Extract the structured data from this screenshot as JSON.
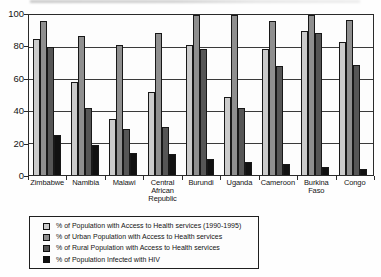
{
  "chart_data": {
    "type": "bar",
    "title": "",
    "xlabel": "",
    "ylabel": "",
    "categories": [
      "Zimbabwe",
      "Namibia",
      "Malawi",
      "Central African Republic",
      "Burundi",
      "Uganda",
      "Cameroon",
      "Burkina Faso",
      "Congo"
    ],
    "series": [
      {
        "name": "% of Population with Access to Health services (1990-1995)",
        "color": "#cbcbcb",
        "values": [
          85,
          58,
          35,
          52,
          81,
          49,
          79,
          90,
          83
        ]
      },
      {
        "name": "% of Urban Population with Access to Health services",
        "color": "#8f8f8f",
        "values": [
          96,
          87,
          81,
          89,
          100,
          100,
          96,
          100,
          97
        ]
      },
      {
        "name": "% of Rural Population with Access to Health services",
        "color": "#565656",
        "values": [
          80,
          42,
          29,
          30,
          79,
          42,
          68,
          89,
          69
        ]
      },
      {
        "name": "% of Population Infected with HIV",
        "color": "#111111",
        "values": [
          25,
          19,
          14,
          13,
          10,
          8,
          7,
          5,
          4
        ]
      }
    ],
    "ylim": [
      0,
      100
    ],
    "yticks": [
      0,
      20,
      40,
      60,
      80,
      100
    ],
    "ytick_labels": [
      "0",
      "20",
      "40",
      "60",
      "80",
      "100"
    ],
    "grid": "horizontal",
    "legend_position": "bottom-left",
    "axis_color": "#2b2b2b"
  }
}
